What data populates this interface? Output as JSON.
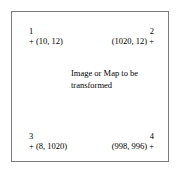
{
  "figure": {
    "caption_lines": [
      "Image or Map to be",
      "transformed"
    ],
    "frame_color": "#7a7a7a",
    "background_color": "#ffffff",
    "text_color": "#000000"
  },
  "control_points": [
    {
      "index": "1",
      "corner": "top-left",
      "marker": "+",
      "coordinate_text": "+ (10, 12)",
      "x": 10,
      "y": 12
    },
    {
      "index": "2",
      "corner": "top-right",
      "marker": "+",
      "coordinate_text": "(1020, 12) +",
      "x": 1020,
      "y": 12
    },
    {
      "index": "3",
      "corner": "bottom-left",
      "marker": "+",
      "coordinate_text": "+ (8, 1020)",
      "x": 8,
      "y": 1020
    },
    {
      "index": "4",
      "corner": "bottom-right",
      "marker": "+",
      "coordinate_text": "(998, 996) +",
      "x": 998,
      "y": 996
    }
  ]
}
